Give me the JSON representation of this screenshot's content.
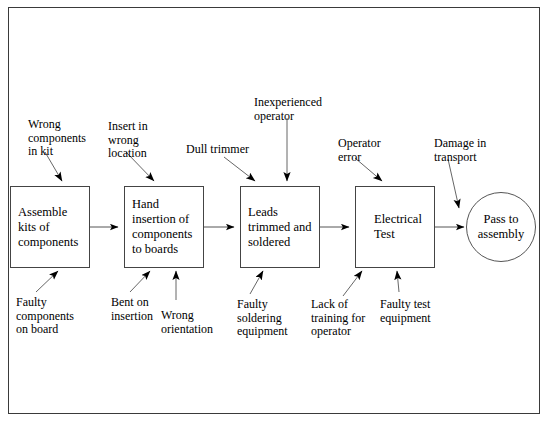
{
  "diagram": {
    "frame": {
      "border_color": "#3a3a3a"
    },
    "process_steps": [
      {
        "id": "assemble-kits",
        "lines": [
          "Assemble",
          "kits of",
          "components"
        ]
      },
      {
        "id": "hand-insertion",
        "lines": [
          "Hand",
          "insertion of",
          "components",
          "to boards"
        ]
      },
      {
        "id": "leads-trimmed",
        "lines": [
          "Leads",
          "trimmed and",
          "soldered"
        ]
      },
      {
        "id": "electrical-test",
        "lines": [
          "Electrical",
          "Test"
        ]
      }
    ],
    "terminator": {
      "id": "pass-to-assembly",
      "lines": [
        "Pass to",
        "assembly"
      ]
    },
    "causes_above": [
      {
        "id": "wrong-components-in-kit",
        "lines": [
          "Wrong",
          "components",
          "in kit"
        ]
      },
      {
        "id": "insert-in-wrong-location",
        "lines": [
          "Insert in",
          "wrong",
          "location"
        ]
      },
      {
        "id": "dull-trimmer",
        "lines": [
          "Dull trimmer"
        ]
      },
      {
        "id": "inexperienced-operator",
        "lines": [
          "Inexperienced",
          "operator"
        ]
      },
      {
        "id": "operator-error",
        "lines": [
          "Operator",
          "error"
        ]
      },
      {
        "id": "damage-in-transport",
        "lines": [
          "Damage in",
          "transport"
        ]
      }
    ],
    "causes_below": [
      {
        "id": "faulty-components-on-board",
        "lines": [
          "Faulty",
          "components",
          "on board"
        ]
      },
      {
        "id": "bent-on-insertion",
        "lines": [
          "Bent on",
          "insertion"
        ]
      },
      {
        "id": "wrong-orientation",
        "lines": [
          "Wrong",
          "orientation"
        ]
      },
      {
        "id": "faulty-soldering-equipment",
        "lines": [
          "Faulty",
          "soldering",
          "equipment"
        ]
      },
      {
        "id": "lack-of-training-for-operator",
        "lines": [
          "Lack of",
          "training for",
          "operator"
        ]
      },
      {
        "id": "faulty-test-equipment",
        "lines": [
          "Faulty test",
          "equipment"
        ]
      }
    ]
  }
}
